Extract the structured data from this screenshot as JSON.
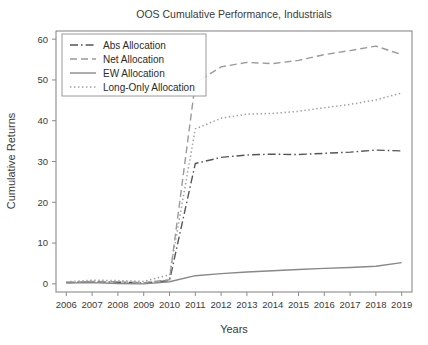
{
  "chart_data": {
    "type": "line",
    "title": "OOS Cumulative Performance, Industrials",
    "xlabel": "Years",
    "ylabel": "Cumulative Returns",
    "grid": false,
    "legend_position": "top-left",
    "xlim": [
      2005.6,
      2019.4
    ],
    "ylim": [
      -2,
      62
    ],
    "yticks": [
      0,
      10,
      20,
      30,
      40,
      50,
      60
    ],
    "x": [
      2006,
      2007,
      2008,
      2009,
      2010,
      2011,
      2012,
      2013,
      2014,
      2015,
      2016,
      2017,
      2018,
      2019
    ],
    "categories": [
      "2006",
      "2007",
      "2008",
      "2009",
      "2010",
      "2011",
      "2012",
      "2013",
      "2014",
      "2015",
      "2016",
      "2017",
      "2018",
      "2019"
    ],
    "series": [
      {
        "name": "Abs Allocation",
        "style": "dash-dot",
        "color": "#555555",
        "values": [
          0.3,
          0.5,
          0.4,
          0.2,
          0.8,
          29.5,
          31.0,
          31.6,
          31.8,
          31.7,
          32.0,
          32.3,
          32.8,
          32.6
        ]
      },
      {
        "name": "Net Allocation",
        "style": "dashed",
        "color": "#9a9a9a",
        "values": [
          0.4,
          0.6,
          0.5,
          0.3,
          1.0,
          49.2,
          53.2,
          54.3,
          54.0,
          54.8,
          56.2,
          57.2,
          58.3,
          56.2
        ]
      },
      {
        "name": "EW Allocation",
        "style": "solid",
        "color": "#888888",
        "values": [
          0.2,
          0.3,
          0.1,
          0.0,
          0.5,
          2.0,
          2.5,
          2.9,
          3.2,
          3.5,
          3.8,
          4.0,
          4.3,
          5.2
        ]
      },
      {
        "name": "Long-Only Allocation",
        "style": "dotted",
        "color": "#9e9e9e",
        "values": [
          0.5,
          0.9,
          0.8,
          0.6,
          2.2,
          38.0,
          40.6,
          41.6,
          41.8,
          42.3,
          43.2,
          44.0,
          45.1,
          46.8
        ]
      }
    ]
  },
  "legend": {
    "entries": [
      {
        "label": "Abs Allocation"
      },
      {
        "label": "Net Allocation"
      },
      {
        "label": "EW Allocation"
      },
      {
        "label": "Long-Only Allocation"
      }
    ]
  }
}
